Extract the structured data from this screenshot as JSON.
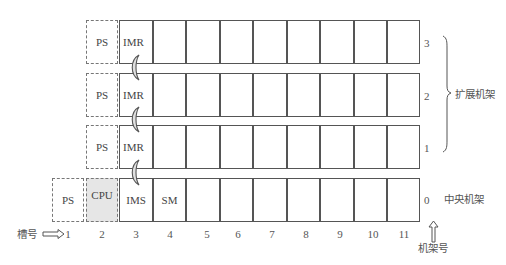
{
  "diagram": {
    "title": "",
    "racks": [
      {
        "rack_number": "3",
        "modules": [
          {
            "slot": 2,
            "label": "PS",
            "style": "dashed"
          },
          {
            "slot": 3,
            "label": "IMR",
            "style": "solid"
          }
        ]
      },
      {
        "rack_number": "2",
        "modules": [
          {
            "slot": 2,
            "label": "PS",
            "style": "dashed"
          },
          {
            "slot": 3,
            "label": "IMR",
            "style": "solid"
          }
        ]
      },
      {
        "rack_number": "1",
        "modules": [
          {
            "slot": 2,
            "label": "PS",
            "style": "dashed"
          },
          {
            "slot": 3,
            "label": "IMR",
            "style": "solid"
          }
        ]
      },
      {
        "rack_number": "0",
        "modules": [
          {
            "slot": 1,
            "label": "PS",
            "style": "dashed"
          },
          {
            "slot": 2,
            "label": "CPU",
            "style": "dashed-shaded"
          },
          {
            "slot": 3,
            "label": "IMS",
            "style": "solid"
          },
          {
            "slot": 4,
            "label": "SM",
            "style": "solid"
          }
        ]
      }
    ],
    "slot_numbers": [
      "1",
      "2",
      "3",
      "4",
      "5",
      "6",
      "7",
      "8",
      "9",
      "10",
      "11"
    ],
    "slot_axis_label": "槽号",
    "rack_axis_label": "机架号",
    "expansion_racks_label": "扩展机架",
    "central_rack_label": "中央机架",
    "labels": {
      "r3_ps": "PS",
      "r3_imr": "IMR",
      "r2_ps": "PS",
      "r2_imr": "IMR",
      "r1_ps": "PS",
      "r1_imr": "IMR",
      "r0_ps": "PS",
      "r0_cpu": "CPU",
      "r0_ims": "IMS",
      "r0_sm": "SM"
    },
    "colors": {
      "line": "#555555",
      "dashed": "#777777",
      "cpu_fill": "#e6e6e6",
      "connector_fill": "#e0e0e0"
    }
  }
}
